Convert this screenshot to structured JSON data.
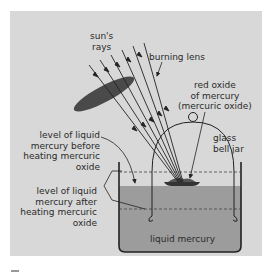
{
  "figure": {
    "colors": {
      "panel": "#d8d8d8",
      "mercury": "#9c9c9c",
      "lens": "#4a4a4a",
      "line": "#222222",
      "background": "#ffffff"
    },
    "labels": {
      "sun_rays": [
        "sun's",
        "rays"
      ],
      "burning_lens": "burning lens",
      "red_oxide": [
        "red oxide",
        "of mercury",
        "(mercuric oxide)"
      ],
      "bell_jar": [
        "glass",
        "bell jar"
      ],
      "level_before": [
        "level of liquid",
        "mercury before",
        "heating mercuric",
        "oxide"
      ],
      "level_after": [
        "level of liquid",
        "mercury after",
        "heating mercuric",
        "oxide"
      ],
      "liquid_mercury": "liquid mercury"
    },
    "caption_fragment": "Fi"
  }
}
